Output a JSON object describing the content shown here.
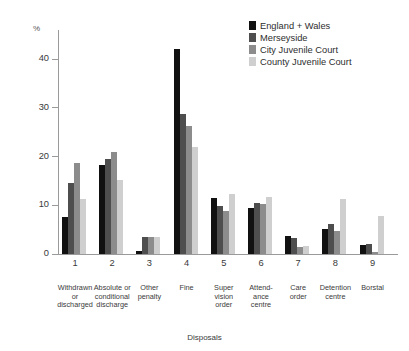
{
  "chart_data": {
    "type": "bar",
    "title": "",
    "xlabel": "Disposals",
    "ylabel": "%",
    "ylim": [
      0,
      46
    ],
    "yticks": [
      0,
      10,
      20,
      30,
      40
    ],
    "grid": false,
    "legend_position": "top-right",
    "x": [
      "1",
      "2",
      "3",
      "4",
      "5",
      "6",
      "7",
      "8",
      "9"
    ],
    "categories": [
      "Withdrawn or discharged",
      "Absolute or conditional discharge",
      "Other penalty",
      "Fine",
      "Super vision order",
      "Attend-ance centre",
      "Care order",
      "Detention centre",
      "Borstal"
    ],
    "category_lines": [
      [
        "Withdrawn",
        "or",
        "discharged"
      ],
      [
        "Absolute or",
        "conditional",
        "discharge"
      ],
      [
        "Other",
        "penalty"
      ],
      [
        "Fine"
      ],
      [
        "Super",
        "vision",
        "order"
      ],
      [
        "Attend-",
        "ance",
        "centre"
      ],
      [
        "Care",
        "order"
      ],
      [
        "Detention",
        "centre"
      ],
      [
        "Borstal"
      ]
    ],
    "series": [
      {
        "name": "England + Wales",
        "color": "#111111",
        "values": [
          7.5,
          18.3,
          0.7,
          42.2,
          11.5,
          9.5,
          3.7,
          5.1,
          1.8
        ]
      },
      {
        "name": "Merseyside",
        "color": "#4e4e4e",
        "values": [
          14.6,
          19.5,
          3.4,
          28.7,
          9.8,
          10.4,
          3.2,
          6.1,
          2.1
        ]
      },
      {
        "name": "City Juvenile Court",
        "color": "#8c8c8c",
        "values": [
          18.7,
          21.0,
          3.4,
          26.3,
          8.8,
          10.2,
          1.5,
          4.8,
          0.5
        ]
      },
      {
        "name": "County Juvenile Court",
        "color": "#cfcfcf",
        "values": [
          11.2,
          15.3,
          3.5,
          22.0,
          12.4,
          11.8,
          1.6,
          11.2,
          7.8
        ]
      }
    ]
  },
  "legend": {
    "items": [
      {
        "label": "England + Wales",
        "color": "#111111"
      },
      {
        "label": "Merseyside",
        "color": "#4e4e4e"
      },
      {
        "label": "City Juvenile Court",
        "color": "#8c8c8c"
      },
      {
        "label": "County Juvenile Court",
        "color": "#cfcfcf"
      }
    ]
  },
  "axes": {
    "y_unit_label": "%",
    "x_title": "Disposals"
  }
}
